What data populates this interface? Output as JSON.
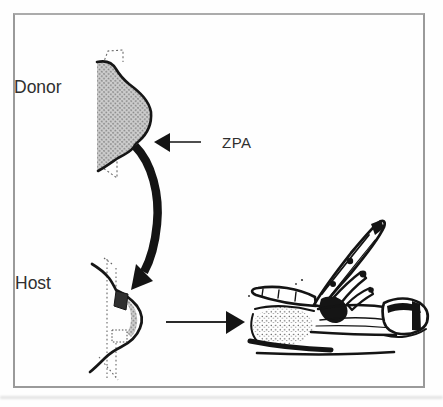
{
  "figure": {
    "type": "scientific-diagram",
    "labels": {
      "donor": "Donor",
      "host": "Host",
      "zpa": "ZPA"
    },
    "colors": {
      "background": "#fefefe",
      "frame_border": "#9a9a9a",
      "ink": "#141414",
      "bud_shading_dot": "#8a8a8a",
      "bud_shading_base": "#cfcfcf",
      "graft_block": "#303030",
      "text": "#2f2f2f"
    },
    "elements": {
      "donor_bud": "shaded donor limb bud with dashed flank outline",
      "zpa_arrow": "left-pointing arrow marking ZPA at posterior of donor bud",
      "graft_arrow": "thick curved arrow showing ZPA graft from donor to host bud",
      "host_bud": "host limb bud outline with dark grafted ZPA block and dotted flank lines",
      "result_arrow": "right-pointing arrow to experimental outcome",
      "result_limb": "ink drawing of wing with mirror-image duplicated digits"
    }
  }
}
